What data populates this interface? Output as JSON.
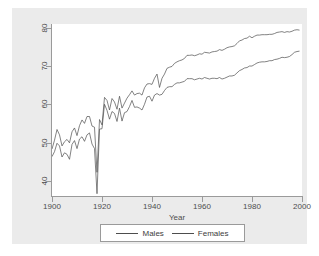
{
  "chart_data": {
    "type": "line",
    "title": "",
    "xlabel": "Year",
    "ylabel": "",
    "xlim": [
      1900,
      2000
    ],
    "ylim": [
      36,
      81
    ],
    "grid": false,
    "legend_position": "bottom",
    "x_ticks": [
      "1900",
      "1920",
      "1940",
      "1960",
      "1980",
      "2000"
    ],
    "x_tick_values": [
      1900,
      1920,
      1940,
      1960,
      1980,
      2000
    ],
    "y_ticks": [
      "40",
      "50",
      "60",
      "70",
      "80"
    ],
    "y_tick_values": [
      40,
      50,
      60,
      70,
      80
    ],
    "x": [
      1900,
      1901,
      1902,
      1903,
      1904,
      1905,
      1906,
      1907,
      1908,
      1909,
      1910,
      1911,
      1912,
      1913,
      1914,
      1915,
      1916,
      1917,
      1918,
      1919,
      1920,
      1921,
      1922,
      1923,
      1924,
      1925,
      1926,
      1927,
      1928,
      1929,
      1930,
      1931,
      1932,
      1933,
      1934,
      1935,
      1936,
      1937,
      1938,
      1939,
      1940,
      1941,
      1942,
      1943,
      1944,
      1945,
      1946,
      1947,
      1948,
      1949,
      1950,
      1951,
      1952,
      1953,
      1954,
      1955,
      1956,
      1957,
      1958,
      1959,
      1960,
      1961,
      1962,
      1963,
      1964,
      1965,
      1966,
      1967,
      1968,
      1969,
      1970,
      1971,
      1972,
      1973,
      1974,
      1975,
      1976,
      1977,
      1978,
      1979,
      1980,
      1981,
      1982,
      1983,
      1984,
      1985,
      1986,
      1987,
      1988,
      1989,
      1990,
      1991,
      1992,
      1993,
      1994,
      1995,
      1996,
      1997,
      1998,
      1999
    ],
    "series": [
      {
        "name": "Males",
        "color": "#4d4d4d",
        "values": [
          46.3,
          47.6,
          49.8,
          49.1,
          46.2,
          47.3,
          46.9,
          45.6,
          49.5,
          50.5,
          48.4,
          50.9,
          51.5,
          50.3,
          52.0,
          52.5,
          49.6,
          48.4,
          36.6,
          53.5,
          53.6,
          60.0,
          58.4,
          56.1,
          58.1,
          57.6,
          55.5,
          59.0,
          55.6,
          57.8,
          58.1,
          59.4,
          61.0,
          59.2,
          59.3,
          59.0,
          58.5,
          60.0,
          61.9,
          62.1,
          60.8,
          62.4,
          62.8,
          62.4,
          62.6,
          63.6,
          64.4,
          64.6,
          64.6,
          65.2,
          65.6,
          65.6,
          65.8,
          66.0,
          66.7,
          66.7,
          66.7,
          66.4,
          66.6,
          66.8,
          66.6,
          67.0,
          66.8,
          66.6,
          66.8,
          66.8,
          66.7,
          67.0,
          66.6,
          66.8,
          67.1,
          67.4,
          67.4,
          67.6,
          68.2,
          68.8,
          69.1,
          69.5,
          69.6,
          70.0,
          70.0,
          70.4,
          70.8,
          71.0,
          71.1,
          71.1,
          71.2,
          71.4,
          71.4,
          71.7,
          71.8,
          72.0,
          72.3,
          72.2,
          72.3,
          72.5,
          73.0,
          73.6,
          73.8,
          73.9
        ]
      },
      {
        "name": "Females",
        "color": "#4d4d4d",
        "values": [
          48.3,
          50.6,
          53.4,
          52.0,
          49.1,
          50.2,
          50.8,
          49.9,
          52.8,
          53.8,
          51.8,
          54.4,
          55.9,
          55.0,
          56.8,
          56.8,
          54.3,
          54.0,
          42.2,
          56.0,
          54.6,
          61.8,
          61.0,
          58.5,
          61.5,
          60.6,
          58.7,
          62.1,
          59.0,
          60.3,
          61.6,
          62.5,
          63.5,
          62.4,
          62.8,
          62.9,
          62.4,
          64.3,
          65.3,
          65.4,
          65.2,
          66.8,
          67.9,
          64.4,
          66.8,
          67.9,
          69.4,
          69.7,
          69.9,
          70.7,
          71.1,
          71.4,
          71.6,
          72.0,
          72.8,
          72.8,
          72.9,
          72.7,
          72.9,
          73.2,
          73.1,
          73.6,
          73.5,
          73.4,
          73.7,
          73.8,
          73.9,
          74.3,
          74.1,
          74.4,
          74.8,
          75.0,
          75.1,
          75.3,
          75.9,
          76.6,
          76.8,
          77.2,
          77.3,
          77.8,
          77.4,
          77.8,
          78.1,
          78.1,
          78.2,
          78.2,
          78.2,
          78.3,
          78.3,
          78.5,
          78.8,
          78.9,
          79.0,
          78.8,
          79.0,
          78.9,
          79.1,
          79.4,
          79.5,
          79.4
        ]
      }
    ]
  },
  "axis": {
    "x_title": "Year"
  },
  "legend": {
    "entries": [
      {
        "label": "Males"
      },
      {
        "label": "Females"
      }
    ]
  }
}
